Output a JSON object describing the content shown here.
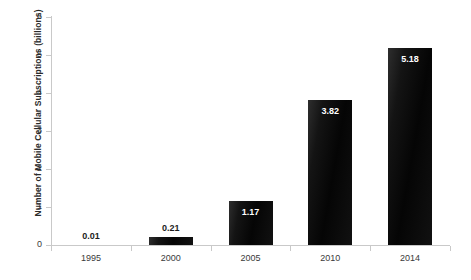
{
  "chart_data": {
    "type": "bar",
    "title": "",
    "xlabel": "",
    "ylabel": "Number of Mobile Cellular Subscriptions (billions)",
    "categories": [
      "1995",
      "2000",
      "2005",
      "2010",
      "2014"
    ],
    "values": [
      0.01,
      0.21,
      1.17,
      3.82,
      5.18
    ],
    "value_labels": [
      "0.01",
      "0.21",
      "1.17",
      "3.82",
      "5.18"
    ],
    "ylim": [
      0,
      6
    ],
    "yticks": [
      0,
      1,
      2,
      3,
      4,
      5,
      6
    ],
    "ytick_labels": [
      "0",
      "1",
      "2",
      "3",
      "4",
      "5",
      "6"
    ],
    "grid": false,
    "legend": null,
    "bar_color": "#0a0a0a",
    "axis_color": "#c9c9c9",
    "label_color_outside": "#1c1c1c",
    "label_color_inside": "#ffffff"
  }
}
